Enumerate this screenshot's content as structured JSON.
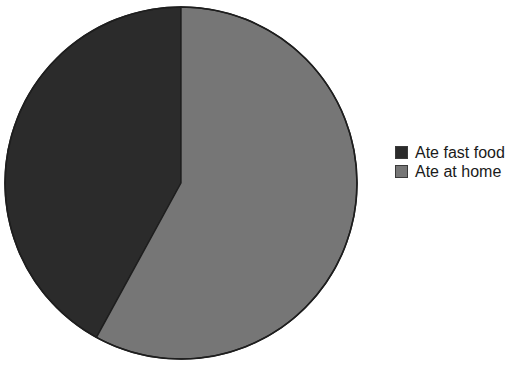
{
  "chart_data": {
    "type": "pie",
    "title": "",
    "subtitle": "",
    "xlabel": "",
    "ylabel": "",
    "grid": false,
    "legend_position": "right",
    "start_angle_deg": 0,
    "direction": "counterclockwise",
    "categories": [
      "Ate fast food",
      "Ate at home"
    ],
    "values": [
      42,
      58
    ],
    "value_unit": "percent",
    "slices": [
      {
        "label": "Ate fast food",
        "value": 42,
        "percent": 42,
        "color": "#2b2b2b",
        "sweep_deg": 151.3
      },
      {
        "label": "Ate at home",
        "value": 58,
        "percent": 58,
        "color": "#767676",
        "sweep_deg": 208.7
      }
    ],
    "annotations": []
  },
  "legend": {
    "items": [
      {
        "label": "Ate fast food",
        "color": "#2b2b2b"
      },
      {
        "label": "Ate at home",
        "color": "#767676"
      }
    ]
  },
  "style": {
    "background": "#ffffff",
    "outline_color": "#1e1e1e",
    "text_color": "#1a1a1a",
    "dark_slice": "#2b2b2b",
    "gray_slice": "#767676"
  },
  "title_remnant": "",
  "geometry": {
    "center_x": 181,
    "center_y": 183,
    "radius": 176
  }
}
